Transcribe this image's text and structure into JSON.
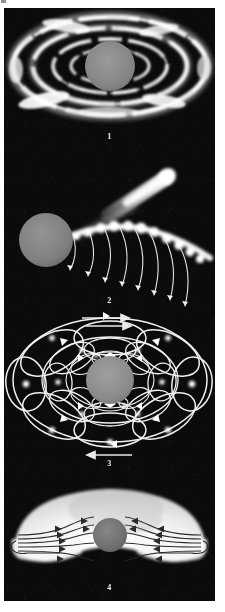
{
  "figure": {
    "background_color": "#0b0b0b",
    "page_color": "#ffffff",
    "core_color": "#808080",
    "line_color": "#f0f0f0",
    "panel_count": 4
  },
  "panels": [
    {
      "id": "panel-1",
      "label": "1",
      "name": "accretion-disk-rings",
      "core": {
        "cx": 106,
        "cy": 58,
        "r": 25,
        "color": "#858585"
      },
      "rings": [
        {
          "rx": 97,
          "ry": 49,
          "thickness": 5
        },
        {
          "rx": 77,
          "ry": 38,
          "thickness": 5
        },
        {
          "rx": 57,
          "ry": 27,
          "thickness": 4
        },
        {
          "rx": 39,
          "ry": 17,
          "thickness": 3
        }
      ],
      "label_y": 126
    },
    {
      "id": "panel-2",
      "label": "2",
      "name": "jet-and-bow-shock",
      "core": {
        "cx": 42,
        "cy": 82,
        "r": 27,
        "color": "#7e7e7e"
      },
      "jet": {
        "x1": 96,
        "y1": 65,
        "x2": 168,
        "y2": 16,
        "width": 11
      },
      "shock_blob_count": 11,
      "arc_count": 8,
      "label_y": 140
    },
    {
      "id": "panel-3",
      "label": "3",
      "name": "circulation-cells",
      "core": {
        "cx": 106,
        "cy": 72,
        "r": 24,
        "color": "#8a8a8a"
      },
      "loop_rings": 3,
      "petals_per_ring": 8,
      "top_arrow": {
        "direction": "right",
        "count": 2,
        "y": 12
      },
      "bottom_arrow": {
        "direction": "left",
        "count": 1,
        "y": 146
      },
      "label_y": 152
    },
    {
      "id": "panel-4",
      "label": "4",
      "name": "inflow-shell",
      "core": {
        "cx": 106,
        "cy": 62,
        "r": 17,
        "color": "#6f6f6f"
      },
      "shell": {
        "color": "#f4f4f4"
      },
      "streamlines_per_side": 5,
      "flow_direction": "inward",
      "label_y": 110
    }
  ]
}
